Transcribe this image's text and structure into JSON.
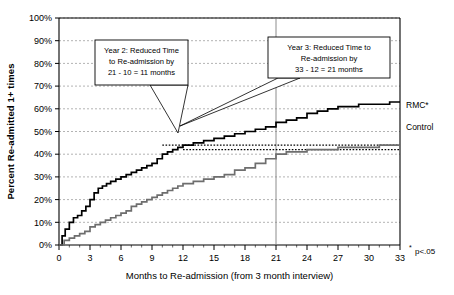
{
  "figure": {
    "background_color": "#ffffff",
    "plot_border_color": "#000000",
    "gridline_color": "#808080"
  },
  "annotations": {
    "callout_1": {
      "name": "year-2-callout",
      "lines": [
        "Year 2: Reduced Time",
        "to Re-admission by",
        "21 - 10 = 11 months"
      ]
    },
    "callout_2": {
      "name": "year-3-callout",
      "lines": [
        "Year 3: Reduced Time to",
        "Re-admission by",
        "33 - 12 = 21 months"
      ]
    },
    "footnote": "p<.05",
    "footnote_marker": "*"
  },
  "legend": {
    "position": "right",
    "entries": [
      {
        "label": "RMC*",
        "color": "#000000"
      },
      {
        "label": "Control",
        "color": "#6e6e6e"
      }
    ]
  },
  "chart_data": {
    "type": "line",
    "title": "",
    "subtitle": "",
    "xlabel": "Months to Re-admission (from 3 month interview)",
    "ylabel": "Percent Re-admitted 1+ times",
    "xlim": [
      0,
      33
    ],
    "ylim": [
      0,
      100
    ],
    "xticks": [
      0,
      3,
      6,
      9,
      12,
      15,
      18,
      21,
      24,
      27,
      30,
      33
    ],
    "xtick_labels": [
      "0",
      "3",
      "6",
      "9",
      "12",
      "15",
      "18",
      "21",
      "24",
      "27",
      "30",
      "33"
    ],
    "yticks": [
      0,
      10,
      20,
      30,
      40,
      50,
      60,
      70,
      80,
      90,
      100
    ],
    "ytick_labels": [
      "0%",
      "10%",
      "20%",
      "30%",
      "40%",
      "50%",
      "60%",
      "70%",
      "80%",
      "90%",
      "100%"
    ],
    "grid": true,
    "grid_axis": "y",
    "legend_position": "right",
    "reference_lines": [
      {
        "name": "vertical-line-21-months",
        "orientation": "vertical",
        "x": 21,
        "style": "solid",
        "color": "#808080"
      },
      {
        "name": "rmc-44pct-dotted",
        "orientation": "horizontal",
        "y": 44,
        "style": "dotted",
        "color": "#000000",
        "x_start": 10,
        "x_end": 33
      },
      {
        "name": "control-42pct-dotted",
        "orientation": "horizontal",
        "y": 42,
        "style": "dotted",
        "color": "#000000",
        "x_start": 12,
        "x_end": 33
      }
    ],
    "series": [
      {
        "name": "RMC*",
        "color": "#000000",
        "x": [
          0,
          0.3,
          0.6,
          1,
          1.4,
          1.8,
          2.2,
          2.6,
          3,
          3.4,
          3.8,
          4.2,
          4.6,
          5,
          5.5,
          6,
          6.5,
          7,
          7.5,
          8,
          8.5,
          9,
          9.5,
          10,
          10.5,
          11,
          11.5,
          12,
          12.5,
          13,
          14,
          15,
          16,
          17,
          18,
          19,
          20,
          21,
          22,
          23,
          24,
          25,
          26,
          27,
          28,
          29,
          30,
          31,
          32,
          33
        ],
        "values": [
          0,
          4,
          7,
          10,
          12,
          13,
          15,
          17,
          20,
          23,
          25,
          26,
          27,
          28,
          29,
          30,
          31,
          32,
          33,
          34,
          35,
          36,
          38,
          40,
          41,
          42,
          43,
          44,
          44,
          45,
          46,
          47,
          48,
          49,
          50,
          51,
          52,
          54,
          55,
          56,
          58,
          59,
          60,
          61,
          61,
          62,
          62,
          62,
          63,
          63
        ]
      },
      {
        "name": "Control",
        "color": "#6e6e6e",
        "x": [
          0,
          0.5,
          1,
          1.5,
          2,
          2.5,
          3,
          3.5,
          4,
          4.5,
          5,
          5.5,
          6,
          6.5,
          7,
          7.5,
          8,
          8.5,
          9,
          9.5,
          10,
          10.5,
          11,
          11.5,
          12,
          13,
          14,
          15,
          16,
          17,
          18,
          19,
          20,
          21,
          22,
          23,
          24,
          25,
          26,
          27,
          28,
          29,
          30,
          31,
          32,
          33
        ],
        "values": [
          0,
          2,
          3,
          4,
          5,
          6,
          8,
          9,
          10,
          11,
          12,
          13,
          14,
          15,
          17,
          18,
          19,
          20,
          21,
          22,
          23,
          24,
          25,
          26,
          27,
          28,
          29,
          30,
          31,
          33,
          34,
          36,
          38,
          40,
          41,
          41,
          42,
          42,
          42,
          43,
          43,
          43,
          43,
          44,
          44,
          44
        ]
      }
    ]
  }
}
